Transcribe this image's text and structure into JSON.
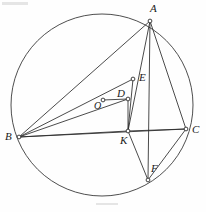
{
  "figure": {
    "width": 206,
    "height": 212,
    "background": "#fefefe",
    "stroke_color": "#2b2b2b",
    "label_color": "#1a1a1a"
  },
  "circle": {
    "name": "circumcircle",
    "cx": 102,
    "cy": 105,
    "r": 91,
    "stroke": "#3a3a3a",
    "stroke_width": 0.9,
    "fill": "none"
  },
  "points": [
    {
      "id": "A",
      "label": "A",
      "x": 150,
      "y": 21,
      "label_x": 150,
      "label_y": 3,
      "marker": true,
      "size": "lg"
    },
    {
      "id": "B",
      "label": "B",
      "x": 19,
      "y": 137,
      "label_x": 5,
      "label_y": 131,
      "marker": true,
      "size": "lg"
    },
    {
      "id": "C",
      "label": "C",
      "x": 186,
      "y": 129,
      "label_x": 192,
      "label_y": 124,
      "marker": true,
      "size": "lg"
    },
    {
      "id": "E",
      "label": "E",
      "x": 133,
      "y": 79,
      "label_x": 139,
      "label_y": 72,
      "marker": true,
      "size": "lg"
    },
    {
      "id": "D",
      "label": "D",
      "x": 128,
      "y": 99,
      "label_x": 117,
      "label_y": 88,
      "marker": true,
      "size": "lg"
    },
    {
      "id": "O",
      "label": "O",
      "x": 103,
      "y": 100,
      "label_x": 94,
      "label_y": 101,
      "marker": true,
      "size": "md"
    },
    {
      "id": "K",
      "label": "K",
      "x": 128,
      "y": 131,
      "label_x": 120,
      "label_y": 135,
      "marker": true,
      "size": "lg"
    },
    {
      "id": "F",
      "label": "F",
      "x": 148,
      "y": 180,
      "label_x": 151,
      "label_y": 163,
      "marker": true,
      "size": "lg"
    }
  ],
  "segments": [
    {
      "name": "segment-A-B",
      "from": "A",
      "to": "B"
    },
    {
      "name": "segment-B-C",
      "from": "B",
      "to": "C"
    },
    {
      "name": "segment-A-C",
      "from": "A",
      "to": "C"
    },
    {
      "name": "segment-B-E",
      "from": "B",
      "to": "E"
    },
    {
      "name": "segment-B-D",
      "from": "B",
      "to": "D"
    },
    {
      "name": "segment-B-K",
      "from": "B",
      "to": "K"
    },
    {
      "name": "segment-O-D",
      "from": "O",
      "to": "D"
    },
    {
      "name": "segment-A-K",
      "from": "A",
      "to": "K"
    },
    {
      "name": "segment-A-F",
      "from": "A",
      "to": "F"
    },
    {
      "name": "segment-E-K",
      "from": "E",
      "to": "K"
    },
    {
      "name": "segment-K-F",
      "from": "K",
      "to": "F"
    },
    {
      "name": "segment-K-C",
      "from": "K",
      "to": "C"
    },
    {
      "name": "segment-C-F",
      "from": "C",
      "to": "F"
    },
    {
      "name": "segment-D-K",
      "from": "D",
      "to": "K"
    }
  ],
  "marks": [
    {
      "name": "scan-smudge-top-left",
      "x": 2,
      "y": 2,
      "w": 26,
      "h": 3
    },
    {
      "name": "scan-smudge-bottom",
      "x": 96,
      "y": 203,
      "w": 22,
      "h": 2
    }
  ]
}
